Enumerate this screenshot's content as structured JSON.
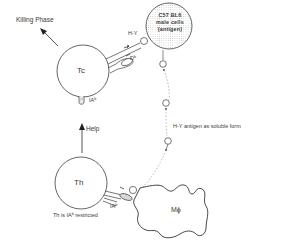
{
  "diagram": {
    "title_label": "Killing Phase",
    "cells": {
      "tc": {
        "label": "Tc"
      },
      "th": {
        "label": "Th"
      },
      "macrophage": {
        "label": "Mϕ"
      },
      "target": {
        "line1": "C57  BL6",
        "line2": "male cells",
        "line3": "(antigen)"
      }
    },
    "receptors": {
      "tc_hy_label": "H-Y",
      "tc_db_label": "Dᵇ",
      "tc_ia_label": "IAᵇ",
      "th_ia_label": "IAᵇ"
    },
    "arrows": {
      "help_label": "Help"
    },
    "notes": {
      "soluble_antigen": "H-Y  antigen  as  soluble  form",
      "restriction": "Th  is  IAᵇ  restricted"
    },
    "colors": {
      "line": "#4a4a4a",
      "text": "#3a3a3a",
      "dashed": "#9a9a9a",
      "stipple": "#bdbdbd"
    }
  }
}
